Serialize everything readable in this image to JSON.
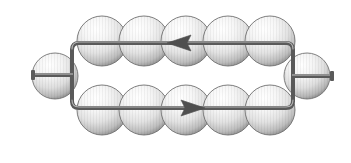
{
  "figure": {
    "title": "Current loop with bead-shaped elements",
    "background_color": "#ffffff",
    "width": 351,
    "height": 163
  },
  "style": {
    "wire_color": "#5a5a5a",
    "wire_highlight": "#b8b8b8",
    "wire_width": 4,
    "sphere_light": "#ffffff",
    "sphere_mid": "#e6e6e6",
    "sphere_dark": "#8c8c8c",
    "sphere_edge": "#6e6e6e",
    "arrow_color": "#4f4f4f"
  },
  "loop": {
    "name": "rectangular-current-loop",
    "left_x": 72,
    "right_x": 293,
    "top_y": 43,
    "bottom_y": 108,
    "corner_radius": 7
  },
  "leads": {
    "left": {
      "label": "left-terminal-lead",
      "x_start": 30,
      "x_end": 72,
      "y": 75,
      "terminal_cap": true
    },
    "right": {
      "label": "right-terminal-lead",
      "x_start": 293,
      "x_end": 330,
      "y": 76,
      "terminal_cap": true
    }
  },
  "terminal_spheres": [
    {
      "name": "left-terminal-sphere",
      "cx": 55,
      "cy": 76,
      "r": 23
    },
    {
      "name": "right-terminal-sphere",
      "cx": 307,
      "cy": 76,
      "r": 23
    }
  ],
  "bead_rows": [
    {
      "name": "top-bead-row",
      "cy": 41,
      "r": 25,
      "count": 5,
      "cx": [
        102,
        144,
        186,
        228,
        270
      ]
    },
    {
      "name": "bottom-bead-row",
      "cy": 110,
      "r": 25,
      "count": 5,
      "cx": [
        102,
        144,
        186,
        228,
        270
      ]
    }
  ],
  "arrows": [
    {
      "name": "top-current-arrow",
      "direction": "left",
      "tip_x": 168,
      "tail_x": 190,
      "y": 43,
      "half_height": 8
    },
    {
      "name": "bottom-current-arrow",
      "direction": "right",
      "tip_x": 204,
      "tail_x": 182,
      "y": 108,
      "half_height": 8
    }
  ]
}
